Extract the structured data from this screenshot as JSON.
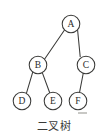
{
  "figure": {
    "caption": "二叉树",
    "background_color": "#ffffff",
    "stroke_color": "#3a3a38",
    "text_color": "#2b2b29",
    "width": 107,
    "height": 138
  },
  "diagram": {
    "type": "binary-tree",
    "node_radius": 8.8,
    "nodes": [
      {
        "id": "A",
        "label": "A",
        "cx": 71,
        "cy": 24,
        "level": 0
      },
      {
        "id": "B",
        "label": "B",
        "cx": 38,
        "cy": 65,
        "level": 1
      },
      {
        "id": "C",
        "label": "C",
        "cx": 86,
        "cy": 65,
        "level": 1
      },
      {
        "id": "D",
        "label": "D",
        "cx": 22,
        "cy": 101,
        "level": 2
      },
      {
        "id": "E",
        "label": "E",
        "cx": 53,
        "cy": 101,
        "level": 2
      },
      {
        "id": "F",
        "label": "F",
        "cx": 78,
        "cy": 101,
        "level": 2
      }
    ],
    "edges": [
      {
        "from": "A",
        "to": "B",
        "side": "left",
        "x1": 64.5,
        "y1": 30.0,
        "x2": 44.5,
        "y2": 59.2
      },
      {
        "from": "A",
        "to": "C",
        "side": "right",
        "x1": 77.6,
        "y1": 30.0,
        "x2": 80.2,
        "y2": 56.8
      },
      {
        "from": "B",
        "to": "D",
        "side": "left",
        "x1": 32.8,
        "y1": 71.8,
        "x2": 26.4,
        "y2": 93.4
      },
      {
        "from": "B",
        "to": "E",
        "side": "right",
        "x1": 42.2,
        "y1": 72.4,
        "x2": 49.8,
        "y2": 93.0
      },
      {
        "from": "C",
        "to": "F",
        "side": "left",
        "x1": 83.2,
        "y1": 73.5,
        "x2": 79.6,
        "y2": 92.2
      }
    ]
  },
  "caption_position": {
    "cx": 54,
    "cy": 126
  }
}
